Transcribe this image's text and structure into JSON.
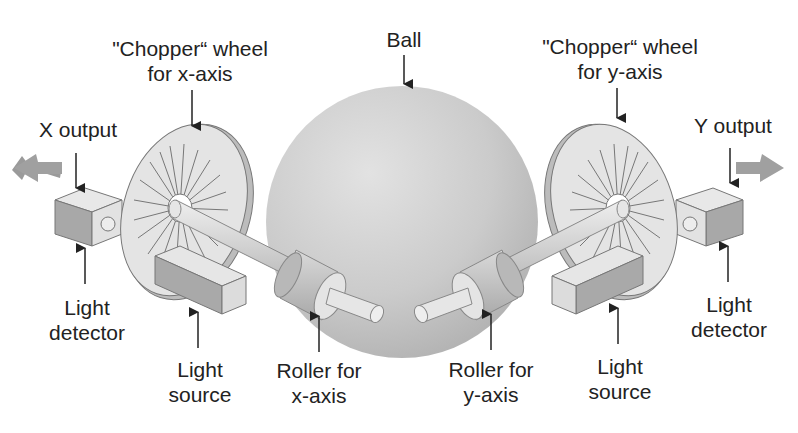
{
  "diagram": {
    "labels": {
      "chopper_x": {
        "line1": "\"Chopper“ wheel",
        "line2": "for x-axis"
      },
      "ball": {
        "line1": "Ball"
      },
      "chopper_y": {
        "line1": "\"Chopper“ wheel",
        "line2": "for y-axis"
      },
      "x_output": {
        "line1": "X output"
      },
      "y_output": {
        "line1": "Y output"
      },
      "light_detector_left": {
        "line1": "Light",
        "line2": "detector"
      },
      "light_source_left": {
        "line1": "Light",
        "line2": "source"
      },
      "roller_x": {
        "line1": "Roller for",
        "line2": "x-axis"
      },
      "roller_y": {
        "line1": "Roller for",
        "line2": "y-axis"
      },
      "light_source_right": {
        "line1": "Light",
        "line2": "source"
      },
      "light_detector_right": {
        "line1": "Light",
        "line2": "detector"
      }
    },
    "colors": {
      "ball": "#c8c8c8",
      "part_light": "#e6e6e6",
      "part_mid": "#cfcfcf",
      "part_dark": "#a9a9a9",
      "output_arrow": "#9a9a9a",
      "outline": "#7a7a7a",
      "text": "#222222"
    }
  }
}
